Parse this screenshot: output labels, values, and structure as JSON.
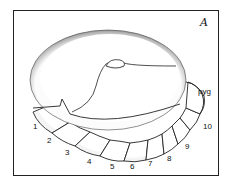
{
  "figure": {
    "panel_label": "A",
    "terminal_label": "pyg",
    "segment_labels": [
      "1",
      "2",
      "3",
      "4",
      "5",
      "6",
      "7",
      "8",
      "9",
      "10"
    ],
    "colors": {
      "ink": "#222222",
      "stipple": "#555555",
      "background": "#ffffff"
    }
  }
}
